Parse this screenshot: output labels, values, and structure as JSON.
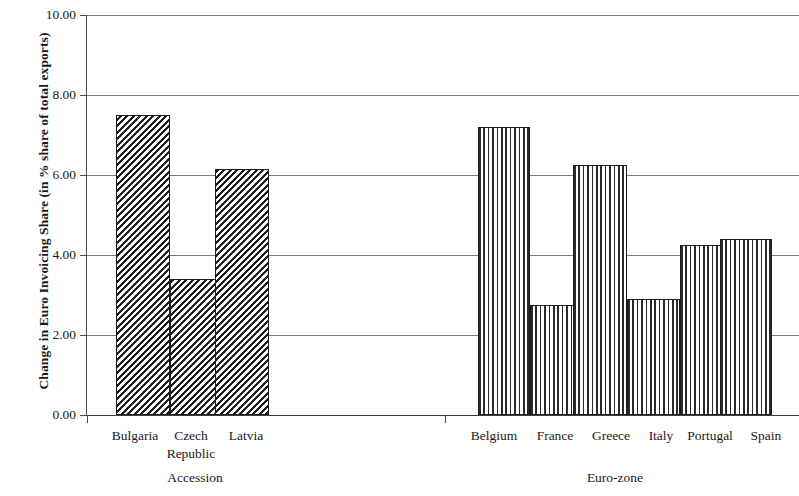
{
  "chart_data": {
    "type": "bar",
    "title": "",
    "xlabel": "",
    "ylabel": "Change in Euro Invoicing Share (in % share of total exports)",
    "ylim": [
      0.0,
      10.0
    ],
    "ytick_labels": [
      "10.00",
      "8.00",
      "6.00",
      "4.00",
      "2.00",
      "0.00"
    ],
    "ytick_values": [
      10.0,
      8.0,
      6.0,
      4.0,
      2.0,
      0.0
    ],
    "grid": "horizontal",
    "legend": "none",
    "groups": [
      {
        "name": "Accession",
        "pattern": "diagonal-hatch",
        "categories": [
          "Bulgaria",
          "Czech Republic",
          "Latvia"
        ],
        "values": [
          7.5,
          3.4,
          6.15
        ]
      },
      {
        "name": "Euro-zone",
        "pattern": "vertical-hatch",
        "categories": [
          "Belgium",
          "France",
          "Greece",
          "Italy",
          "Portugal",
          "Spain"
        ],
        "values": [
          7.2,
          2.75,
          6.25,
          2.9,
          4.25,
          4.4
        ]
      }
    ],
    "categories": [
      "Bulgaria",
      "Czech Republic",
      "Latvia",
      "Belgium",
      "France",
      "Greece",
      "Italy",
      "Portugal",
      "Spain"
    ],
    "values": [
      7.5,
      3.4,
      6.15,
      7.2,
      2.75,
      6.25,
      2.9,
      4.25,
      4.4
    ]
  },
  "labels": {
    "cat_bulgaria": "Bulgaria",
    "cat_czech_line1": "Czech",
    "cat_czech_line2": "Republic",
    "cat_latvia": "Latvia",
    "cat_belgium": "Belgium",
    "cat_france": "France",
    "cat_greece": "Greece",
    "cat_italy": "Italy",
    "cat_portugal": "Portugal",
    "cat_spain": "Spain",
    "group_accession": "Accession",
    "group_eurozone": "Euro-zone"
  },
  "ticks": {
    "y0": "10.00",
    "y1": "8.00",
    "y2": "6.00",
    "y3": "4.00",
    "y4": "2.00",
    "y5": "0.00"
  },
  "colors": {
    "background": "#ffffff",
    "axis": "#3d3d3d",
    "grid": "#7b7b7b",
    "bar_outline": "#1c1c1c",
    "hatch": "#1e1e1e",
    "text": "#1a1a1a"
  }
}
